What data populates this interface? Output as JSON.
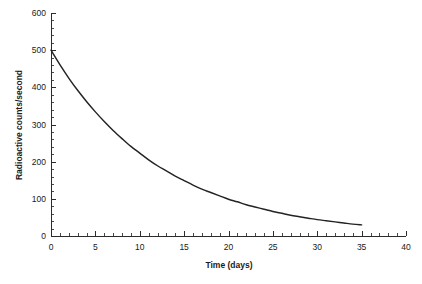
{
  "chart_data": {
    "type": "line",
    "title": "",
    "subtitle": "",
    "xlabel": "Time (days)",
    "ylabel": "Radioactive counts/second",
    "xlim": [
      0,
      40
    ],
    "ylim": [
      0,
      600
    ],
    "grid": false,
    "legend": null,
    "x_ticks": [
      0,
      5,
      10,
      15,
      20,
      25,
      30,
      35,
      40
    ],
    "x_tick_labels": [
      "0",
      "5",
      "10",
      "15",
      "20",
      "25",
      "30",
      "35",
      "40"
    ],
    "x_minor_tick_step": 1,
    "y_ticks": [
      0,
      100,
      200,
      300,
      400,
      500,
      600
    ],
    "y_tick_labels": [
      "0",
      "100",
      "200",
      "300",
      "400",
      "500",
      "600"
    ],
    "y_minor_tick_step": 20,
    "series": [
      {
        "name": "Radioactive decay",
        "color": "#232323",
        "x": [
          0,
          1,
          2,
          3,
          4,
          5,
          6,
          7,
          8,
          9,
          10,
          11,
          12,
          13,
          14,
          15,
          16,
          17,
          18,
          19,
          20,
          21,
          22,
          23,
          24,
          25,
          26,
          27,
          28,
          29,
          30,
          31,
          32,
          33,
          34,
          35
        ],
        "values": [
          500,
          461,
          425,
          392,
          362,
          334,
          308,
          284,
          262,
          241,
          223,
          205,
          189,
          175,
          161,
          149,
          137,
          126,
          117,
          108,
          99,
          92,
          84,
          78,
          72,
          66,
          61,
          56,
          52,
          48,
          44,
          41,
          38,
          35,
          32,
          30
        ]
      }
    ],
    "annotations": []
  },
  "plot_geometry": {
    "origin_x": 51,
    "origin_y": 236,
    "x_axis_end": 406,
    "y_axis_top": 13
  }
}
